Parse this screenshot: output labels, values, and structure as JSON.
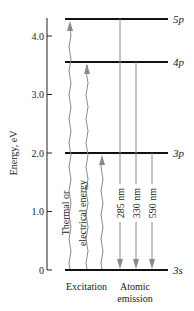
{
  "axis": {
    "label": "Energy, eV",
    "ticks": [
      {
        "value": 0,
        "label": "0"
      },
      {
        "value": 1.0,
        "label": "1.0"
      },
      {
        "value": 2.0,
        "label": "2.0"
      },
      {
        "value": 3.0,
        "label": "3.0"
      },
      {
        "value": 4.0,
        "label": "4.0"
      }
    ]
  },
  "levels": [
    {
      "name": "3s",
      "label_main": "3",
      "label_orb": "s",
      "energy": 0
    },
    {
      "name": "3p",
      "label_main": "3",
      "label_orb": "p",
      "energy": 2.0
    },
    {
      "name": "4p",
      "label_main": "4",
      "label_orb": "p",
      "energy": 3.55
    },
    {
      "name": "5p",
      "label_main": "5",
      "label_orb": "p",
      "energy": 4.3
    }
  ],
  "excitation": {
    "label_line1": "Thermal or",
    "label_line2": "electrical energy",
    "caption": "Excitation",
    "arrows": [
      {
        "from": "3s",
        "to": "5p"
      },
      {
        "from": "3s",
        "to": "4p"
      },
      {
        "from": "3s",
        "to": "3p"
      }
    ]
  },
  "emission": {
    "caption_line1": "Atomic",
    "caption_line2": "emission",
    "arrows": [
      {
        "from": "5p",
        "to": "3s",
        "wavelength": "285 nm"
      },
      {
        "from": "4p",
        "to": "3s",
        "wavelength": "330 nm"
      },
      {
        "from": "3p",
        "to": "3s",
        "wavelength": "590 nm"
      }
    ]
  },
  "colors": {
    "level_line": "#111111",
    "arrow": "#8a8a8a",
    "axis": "#222222"
  }
}
